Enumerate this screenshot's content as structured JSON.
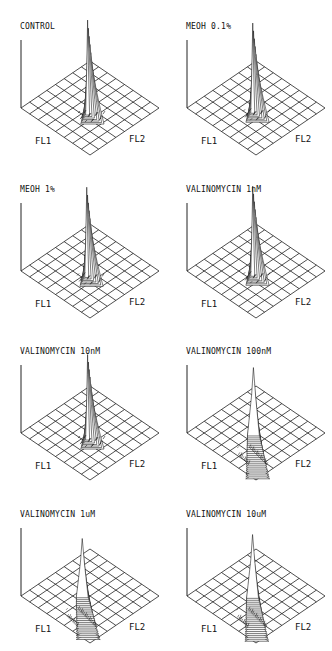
{
  "figure": {
    "axis_labels": {
      "x": "FL1",
      "y": "FL2"
    },
    "grid_cells": 8
  },
  "panels": [
    {
      "title": "CONTROL",
      "xlabel": "FL1",
      "ylabel": "FL2"
    },
    {
      "title": "MEOH 0.1%",
      "xlabel": "FL1",
      "ylabel": "FL2"
    },
    {
      "title": "MEOH 1%",
      "xlabel": "FL1",
      "ylabel": "FL2"
    },
    {
      "title": "VALINOMYCIN 1nM",
      "xlabel": "FL1",
      "ylabel": "FL2"
    },
    {
      "title": "VALINOMYCIN 10nM",
      "xlabel": "FL1",
      "ylabel": "FL2"
    },
    {
      "title": "VALINOMYCIN 100nM",
      "xlabel": "FL1",
      "ylabel": "FL2"
    },
    {
      "title": "VALINOMYCIN 1uM",
      "xlabel": "FL1",
      "ylabel": "FL2"
    },
    {
      "title": "VALINOMYCIN 10uM",
      "xlabel": "FL1",
      "ylabel": "FL2"
    }
  ],
  "chart_data": [
    {
      "type": "heatmap",
      "title": "CONTROL",
      "xlabel": "FL1",
      "ylabel": "FL2",
      "grid": true,
      "peak": {
        "fl1_cell": 4.6,
        "fl2_cell": 3.4,
        "height": 1.0,
        "spread": "narrow"
      },
      "tail": "small scatter near peak base"
    },
    {
      "type": "heatmap",
      "title": "MEOH 0.1%",
      "xlabel": "FL1",
      "ylabel": "FL2",
      "grid": true,
      "peak": {
        "fl1_cell": 4.4,
        "fl2_cell": 3.5,
        "height": 0.95,
        "spread": "narrow"
      },
      "tail": "minimal"
    },
    {
      "type": "heatmap",
      "title": "MEOH 1%",
      "xlabel": "FL1",
      "ylabel": "FL2",
      "grid": true,
      "peak": {
        "fl1_cell": 4.5,
        "fl2_cell": 3.4,
        "height": 0.95,
        "spread": "narrow"
      },
      "tail": "small scatter toward FL1"
    },
    {
      "type": "heatmap",
      "title": "VALINOMYCIN 1nM",
      "xlabel": "FL1",
      "ylabel": "FL2",
      "grid": true,
      "peak": {
        "fl1_cell": 4.4,
        "fl2_cell": 3.5,
        "height": 0.95,
        "spread": "narrow"
      },
      "tail": "minimal"
    },
    {
      "type": "heatmap",
      "title": "VALINOMYCIN 10nM",
      "xlabel": "FL1",
      "ylabel": "FL2",
      "grid": true,
      "peak": {
        "fl1_cell": 4.6,
        "fl2_cell": 3.4,
        "height": 0.9,
        "spread": "narrow"
      },
      "tail": "moderate spread toward high FL1"
    },
    {
      "type": "heatmap",
      "title": "VALINOMYCIN 100nM",
      "xlabel": "FL1",
      "ylabel": "FL2",
      "grid": true,
      "peak": {
        "fl1_cell": 4.6,
        "fl2_cell": 3.0,
        "height": 0.75,
        "spread": "broad"
      },
      "tail": "broad ridge extending to FL1 axis edge and scatter toward FL2"
    },
    {
      "type": "heatmap",
      "title": "VALINOMYCIN 1uM",
      "xlabel": "FL1",
      "ylabel": "FL2",
      "grid": true,
      "peak": {
        "fl1_cell": 4.2,
        "fl2_cell": 2.8,
        "height": 0.65,
        "spread": "broad"
      },
      "tail": "broad ridge extending to FL1 axis edge and scatter toward FL2"
    },
    {
      "type": "heatmap",
      "title": "VALINOMYCIN 10uM",
      "xlabel": "FL1",
      "ylabel": "FL2",
      "grid": true,
      "peak": {
        "fl1_cell": 4.5,
        "fl2_cell": 3.0,
        "height": 0.7,
        "spread": "broad"
      },
      "tail": "broad ridge extending to FL1 axis edge and scatter toward FL2"
    }
  ]
}
